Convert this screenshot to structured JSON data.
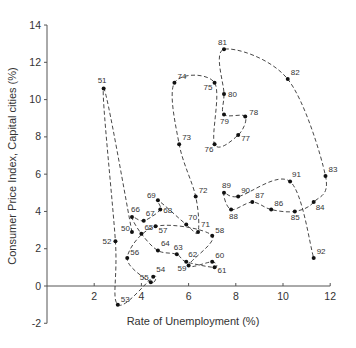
{
  "chart_data": {
    "type": "line",
    "subtype": "connected-scatter",
    "title": "",
    "xlabel": "Rate of Unemployment (%)",
    "ylabel": "Consumer Price Index, Capital cities (%)",
    "xlim": [
      0,
      12
    ],
    "ylim": [
      -2,
      14
    ],
    "xticks": [
      2,
      4,
      6,
      8,
      10,
      12
    ],
    "yticks": [
      -2,
      0,
      2,
      4,
      6,
      8,
      10,
      12,
      14
    ],
    "grid": false,
    "legend": null,
    "line_style": "dashed",
    "series": [
      {
        "name": "Year (19xx)",
        "points": [
          {
            "label": "50",
            "x": 3.6,
            "y": 2.9,
            "dx": -11,
            "dy": -1
          },
          {
            "label": "51",
            "x": 2.4,
            "y": 10.6,
            "dx": -6,
            "dy": -5
          },
          {
            "label": "52",
            "x": 2.9,
            "y": 2.4,
            "dx": -13,
            "dy": 3
          },
          {
            "label": "53",
            "x": 3.0,
            "y": -1.0,
            "dx": 3,
            "dy": -3
          },
          {
            "label": "54",
            "x": 4.5,
            "y": 0.5,
            "dx": 3,
            "dy": -5
          },
          {
            "label": "55",
            "x": 4.4,
            "y": 0.2,
            "dx": -11,
            "dy": -2
          },
          {
            "label": "56",
            "x": 3.4,
            "y": 1.5,
            "dx": 3,
            "dy": -3
          },
          {
            "label": "57",
            "x": 4.6,
            "y": 3.2,
            "dx": 3,
            "dy": 7
          },
          {
            "label": "58",
            "x": 7.0,
            "y": 2.7,
            "dx": 3,
            "dy": -3
          },
          {
            "label": "59",
            "x": 6.0,
            "y": 1.1,
            "dx": -11,
            "dy": 6
          },
          {
            "label": "60",
            "x": 7.0,
            "y": 1.3,
            "dx": 3,
            "dy": -4
          },
          {
            "label": "61",
            "x": 7.1,
            "y": 1.0,
            "dx": 3,
            "dy": 6
          },
          {
            "label": "62",
            "x": 5.9,
            "y": 1.3,
            "dx": 2,
            "dy": -5
          },
          {
            "label": "63",
            "x": 5.5,
            "y": 1.7,
            "dx": -3,
            "dy": -4
          },
          {
            "label": "64",
            "x": 4.7,
            "y": 1.9,
            "dx": 3,
            "dy": -5
          },
          {
            "label": "65",
            "x": 4.0,
            "y": 2.8,
            "dx": 3,
            "dy": -4
          },
          {
            "label": "66",
            "x": 3.6,
            "y": 3.7,
            "dx": -1,
            "dy": -5
          },
          {
            "label": "67",
            "x": 4.1,
            "y": 3.5,
            "dx": 2,
            "dy": -5
          },
          {
            "label": "68",
            "x": 4.8,
            "y": 4.1,
            "dx": 3,
            "dy": 3
          },
          {
            "label": "69",
            "x": 4.7,
            "y": 4.6,
            "dx": -11,
            "dy": -2
          },
          {
            "label": "70",
            "x": 5.9,
            "y": 3.3,
            "dx": 2,
            "dy": -4
          },
          {
            "label": "71",
            "x": 6.4,
            "y": 2.9,
            "dx": 0,
            "dy": -5
          },
          {
            "label": "72",
            "x": 6.3,
            "y": 4.8,
            "dx": 3,
            "dy": -4
          },
          {
            "label": "73",
            "x": 5.6,
            "y": 7.6,
            "dx": 3,
            "dy": -4
          },
          {
            "label": "74",
            "x": 5.4,
            "y": 10.9,
            "dx": 3,
            "dy": -4
          },
          {
            "label": "75",
            "x": 7.1,
            "y": 10.9,
            "dx": -11,
            "dy": 7
          },
          {
            "label": "76",
            "x": 7.1,
            "y": 7.6,
            "dx": -10,
            "dy": 8
          },
          {
            "label": "77",
            "x": 8.1,
            "y": 8.1,
            "dx": 3,
            "dy": 6
          },
          {
            "label": "78",
            "x": 8.4,
            "y": 9.1,
            "dx": 4,
            "dy": -1
          },
          {
            "label": "79",
            "x": 7.5,
            "y": 9.2,
            "dx": -4,
            "dy": 9
          },
          {
            "label": "80",
            "x": 7.5,
            "y": 10.3,
            "dx": 4,
            "dy": 3
          },
          {
            "label": "81",
            "x": 7.5,
            "y": 12.7,
            "dx": -6,
            "dy": -4
          },
          {
            "label": "82",
            "x": 10.2,
            "y": 11.1,
            "dx": 3,
            "dy": -4
          },
          {
            "label": "83",
            "x": 11.8,
            "y": 5.9,
            "dx": 3,
            "dy": -4
          },
          {
            "label": "84",
            "x": 11.3,
            "y": 4.5,
            "dx": 2,
            "dy": 8
          },
          {
            "label": "85",
            "x": 10.5,
            "y": 4.0,
            "dx": -4,
            "dy": 9
          },
          {
            "label": "86",
            "x": 9.5,
            "y": 4.1,
            "dx": 3,
            "dy": -4
          },
          {
            "label": "87",
            "x": 8.7,
            "y": 4.5,
            "dx": 3,
            "dy": -4
          },
          {
            "label": "88",
            "x": 7.8,
            "y": 4.1,
            "dx": -2,
            "dy": 9
          },
          {
            "label": "89",
            "x": 7.5,
            "y": 5.0,
            "dx": -2,
            "dy": -5
          },
          {
            "label": "90",
            "x": 8.1,
            "y": 4.8,
            "dx": 3,
            "dy": -4
          },
          {
            "label": "91",
            "x": 10.3,
            "y": 5.6,
            "dx": 2,
            "dy": -5
          },
          {
            "label": "92",
            "x": 11.3,
            "y": 1.5,
            "dx": 3,
            "dy": -4
          }
        ]
      }
    ]
  }
}
